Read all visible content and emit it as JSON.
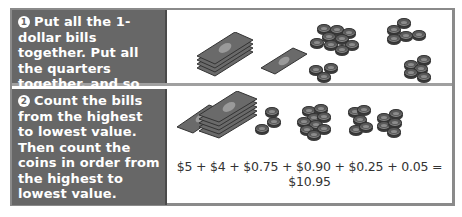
{
  "steps": [
    {
      "number": "1",
      "text": "Put all the 1-dollar bills together. Put all the quarters together, and so on."
    },
    {
      "number": "2",
      "text": "Count the bills from the highest to lowest value. Then count the coins in order from the highest to lowest value."
    }
  ],
  "illustrations": {
    "step1": [
      "stack-of-dollar-bills-icon",
      "dollar-bill-icon",
      "coin-pile-icon",
      "coin-pile-icon",
      "coin-pile-icon",
      "coin-pile-icon"
    ],
    "step2": [
      "dollar-bill-icon",
      "stack-of-dollar-bills-icon",
      "coin-pile-icon",
      "coin-pile-icon",
      "coin-pile-icon",
      "coin-pile-icon"
    ]
  },
  "equation": "$5 + $4 + $0.75 + $0.90 + $0.25 + 0.05 = $10.95",
  "colors": {
    "step_panel": "#676767",
    "step_text": "#ffffff",
    "border": "#8a8a8a"
  }
}
